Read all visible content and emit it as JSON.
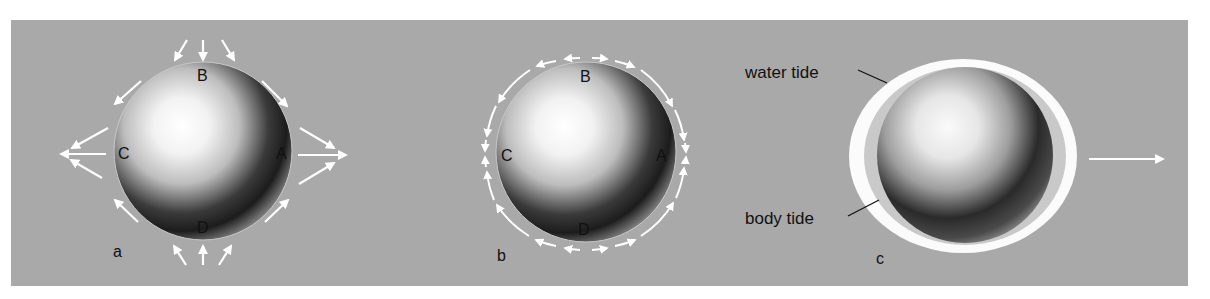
{
  "figure": {
    "background_color": "#ffffff",
    "panel_color": "#a9a9a9",
    "arrow_color": "#ffffff",
    "label_color": "#111111"
  },
  "panels": [
    {
      "id": "a",
      "caption": "a",
      "points": {
        "A": "A",
        "B": "B",
        "C": "C",
        "D": "D"
      },
      "description": "Tidal force arrows: stretching outward at A and C, compressing inward at B and D"
    },
    {
      "id": "b",
      "caption": "b",
      "points": {
        "A": "A",
        "B": "B",
        "C": "C",
        "D": "D"
      },
      "description": "Tangential arrows around the sphere flowing from B and D toward A and C"
    },
    {
      "id": "c",
      "caption": "c",
      "labels": {
        "water_tide": "water tide",
        "body_tide": "body tide"
      },
      "description": "Earth with body tide and water tide bulges, arrow pointing right"
    }
  ]
}
